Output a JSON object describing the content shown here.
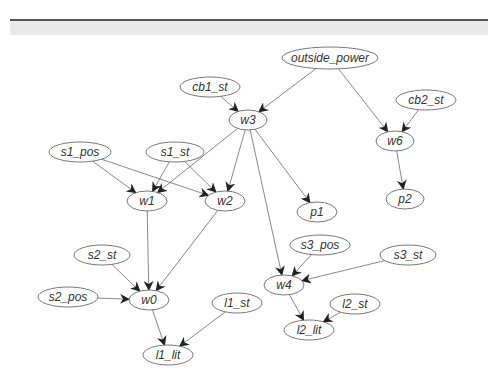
{
  "header": {
    "band_text": ""
  },
  "graph": {
    "nodes": [
      {
        "id": "outside_power",
        "label": "outside_power",
        "x": 330,
        "y": 58,
        "rx": 48,
        "ry": 11
      },
      {
        "id": "cb1_st",
        "label": "cb1_st",
        "x": 210,
        "y": 87,
        "rx": 30,
        "ry": 10
      },
      {
        "id": "w3",
        "label": "w3",
        "x": 248,
        "y": 120,
        "rx": 19,
        "ry": 10
      },
      {
        "id": "cb2_st",
        "label": "cb2_st",
        "x": 426,
        "y": 100,
        "rx": 30,
        "ry": 10
      },
      {
        "id": "w6",
        "label": "w6",
        "x": 395,
        "y": 141,
        "rx": 19,
        "ry": 10
      },
      {
        "id": "s1_pos",
        "label": "s1_pos",
        "x": 80,
        "y": 152,
        "rx": 31,
        "ry": 10
      },
      {
        "id": "s1_st",
        "label": "s1_st",
        "x": 175,
        "y": 152,
        "rx": 29,
        "ry": 10
      },
      {
        "id": "w1",
        "label": "w1",
        "x": 147,
        "y": 201,
        "rx": 20,
        "ry": 10
      },
      {
        "id": "w2",
        "label": "w2",
        "x": 225,
        "y": 201,
        "rx": 20,
        "ry": 10
      },
      {
        "id": "p1",
        "label": "p1",
        "x": 317,
        "y": 212,
        "rx": 20,
        "ry": 10
      },
      {
        "id": "p2",
        "label": "p2",
        "x": 405,
        "y": 199,
        "rx": 19,
        "ry": 10
      },
      {
        "id": "s3_pos",
        "label": "s3_pos",
        "x": 320,
        "y": 245,
        "rx": 30,
        "ry": 10
      },
      {
        "id": "s3_st",
        "label": "s3_st",
        "x": 408,
        "y": 255,
        "rx": 28,
        "ry": 10
      },
      {
        "id": "s2_st",
        "label": "s2_st",
        "x": 102,
        "y": 255,
        "rx": 28,
        "ry": 10
      },
      {
        "id": "s2_pos",
        "label": "s2_pos",
        "x": 68,
        "y": 297,
        "rx": 30,
        "ry": 10
      },
      {
        "id": "w0",
        "label": "w0",
        "x": 149,
        "y": 300,
        "rx": 20,
        "ry": 10
      },
      {
        "id": "w4",
        "label": "w4",
        "x": 284,
        "y": 285,
        "rx": 20,
        "ry": 10
      },
      {
        "id": "l1_st",
        "label": "l1_st",
        "x": 237,
        "y": 303,
        "rx": 25,
        "ry": 10
      },
      {
        "id": "l2_st",
        "label": "l2_st",
        "x": 355,
        "y": 304,
        "rx": 25,
        "ry": 10
      },
      {
        "id": "l1_lit",
        "label": "l1_lit",
        "x": 168,
        "y": 355,
        "rx": 25,
        "ry": 10
      },
      {
        "id": "l2_lit",
        "label": "l2_lit",
        "x": 309,
        "y": 330,
        "rx": 25,
        "ry": 10
      }
    ],
    "edges": [
      [
        "outside_power",
        "w3"
      ],
      [
        "outside_power",
        "w6"
      ],
      [
        "cb1_st",
        "w3"
      ],
      [
        "cb2_st",
        "w6"
      ],
      [
        "w6",
        "p2"
      ],
      [
        "w3",
        "w1"
      ],
      [
        "w3",
        "w2"
      ],
      [
        "w3",
        "p1"
      ],
      [
        "w3",
        "w4"
      ],
      [
        "s1_pos",
        "w1"
      ],
      [
        "s1_pos",
        "w2"
      ],
      [
        "s1_st",
        "w1"
      ],
      [
        "s1_st",
        "w2"
      ],
      [
        "w1",
        "w0"
      ],
      [
        "w2",
        "w0"
      ],
      [
        "s2_st",
        "w0"
      ],
      [
        "s2_pos",
        "w0"
      ],
      [
        "w0",
        "l1_lit"
      ],
      [
        "l1_st",
        "l1_lit"
      ],
      [
        "s3_pos",
        "w4"
      ],
      [
        "s3_st",
        "w4"
      ],
      [
        "w4",
        "l2_lit"
      ],
      [
        "l2_st",
        "l2_lit"
      ]
    ]
  }
}
